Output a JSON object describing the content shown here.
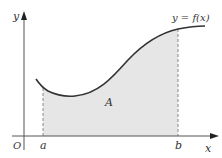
{
  "diagram": {
    "labels": {
      "y_axis": "y",
      "x_axis": "x",
      "origin": "O",
      "a": "a",
      "b": "b",
      "area": "A",
      "curve": "y = f(x)"
    },
    "colors": {
      "axis": "#555555",
      "curve": "#333333",
      "fill": "#e6e6e6",
      "dashed": "#888888",
      "text": "#333333"
    }
  }
}
